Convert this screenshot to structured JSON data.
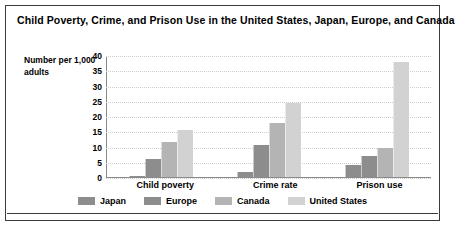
{
  "chart_data": {
    "type": "bar",
    "title": "Child Poverty, Crime, and Prison Use in the United States, Japan, Europe, and Canada",
    "xlabel": "",
    "ylabel": "Number per 1,000 adults",
    "ylim": [
      0,
      40
    ],
    "yticks": [
      40,
      35,
      30,
      25,
      20,
      15,
      10,
      5,
      0
    ],
    "grid": true,
    "legend_position": "bottom",
    "categories": [
      "Child poverty",
      "Crime rate",
      "Prison use"
    ],
    "series": [
      {
        "name": "Japan",
        "color": "#8d8d8d",
        "values": [
          0.3,
          1.5,
          4.0
        ]
      },
      {
        "name": "Europe",
        "color": "#8d8d8d",
        "values": [
          6.0,
          10.5,
          7.0
        ]
      },
      {
        "name": "Canada",
        "color": "#b4b4b4",
        "values": [
          11.5,
          18.0,
          9.5
        ]
      },
      {
        "name": "United States",
        "color": "#d2d2d2",
        "values": [
          15.5,
          24.5,
          38.0
        ]
      }
    ]
  },
  "legend": {
    "items": [
      {
        "label": "Japan"
      },
      {
        "label": "Europe"
      },
      {
        "label": "Canada"
      },
      {
        "label": "United States"
      }
    ]
  }
}
